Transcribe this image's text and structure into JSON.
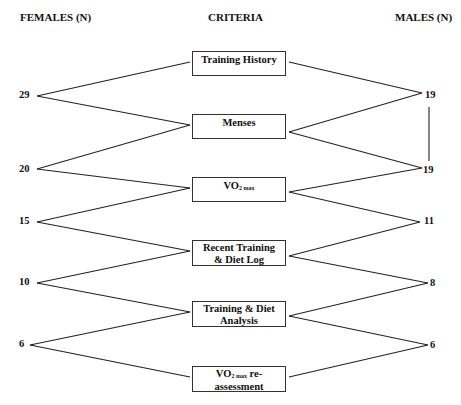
{
  "headers": {
    "females": "FEMALES (N)",
    "criteria": "CRITERIA",
    "males": "MALES (N)"
  },
  "criteria": [
    {
      "line1": "Training History",
      "line2": ""
    },
    {
      "line1": "Menses",
      "line2": ""
    },
    {
      "pre": "VO",
      "sub": "2 max",
      "post": "",
      "line2": ""
    },
    {
      "line1": "Recent Training",
      "line2": "& Diet Log"
    },
    {
      "line1": "Training & Diet",
      "line2": "Analysis"
    },
    {
      "pre": "VO",
      "sub": "2 max",
      "post": " re-",
      "line2": "assessment"
    }
  ],
  "females": [
    "29",
    "20",
    "15",
    "10",
    "6"
  ],
  "males": [
    "19",
    "19",
    "11",
    "8",
    "6"
  ]
}
